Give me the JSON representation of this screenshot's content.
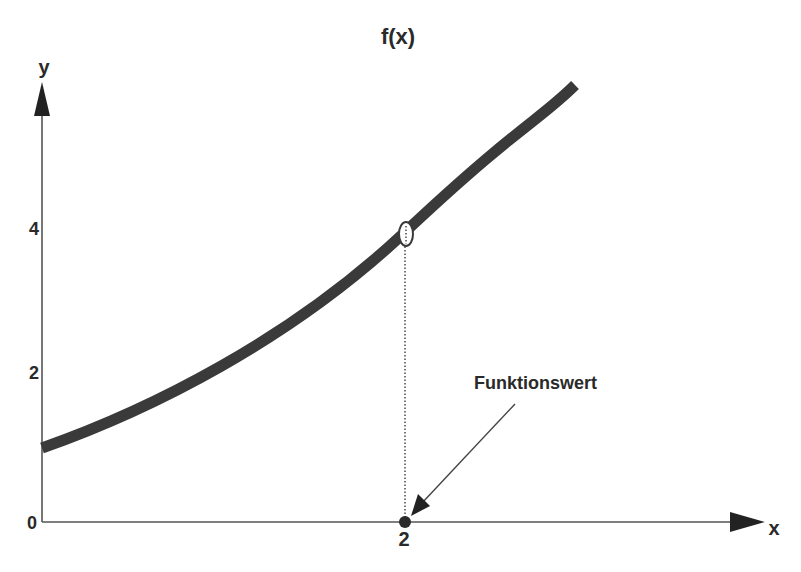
{
  "title": "f(x)",
  "axes": {
    "x_label": "x",
    "y_label": "y",
    "x_ticks": [
      {
        "value": 2,
        "label": "2"
      }
    ],
    "y_ticks": [
      {
        "value": 0,
        "label": "0"
      },
      {
        "value": 2,
        "label": "2"
      },
      {
        "value": 4,
        "label": "4"
      }
    ]
  },
  "curve": {
    "name": "f(x)",
    "color": "#3a3a3a",
    "points": [
      [
        0,
        1.0
      ],
      [
        0.5,
        1.5
      ],
      [
        1.0,
        2.1
      ],
      [
        1.5,
        2.95
      ],
      [
        2.0,
        4.0
      ],
      [
        2.5,
        5.0
      ],
      [
        2.94,
        5.95
      ]
    ]
  },
  "highlight": {
    "x": 2,
    "y": 4
  },
  "annotation": {
    "text": "Funktionswert"
  },
  "colors": {
    "axis": "#555555",
    "curve": "#3a3a3a",
    "text": "#2a2a2a"
  }
}
